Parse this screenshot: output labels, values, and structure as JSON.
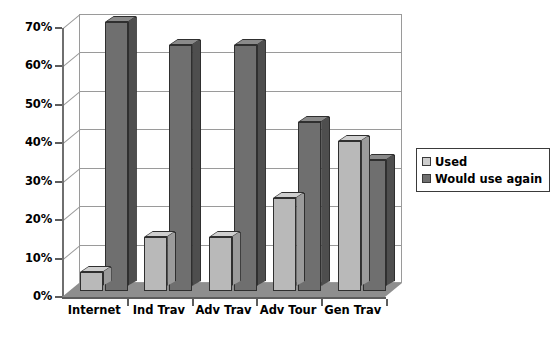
{
  "chart_data": {
    "type": "bar",
    "title": "",
    "subtitle": "",
    "xlabel": "",
    "ylabel": "",
    "categories": [
      "Internet",
      "Ind Trav",
      "Adv Trav",
      "Adv Tour",
      "Gen Trav"
    ],
    "series": [
      {
        "name": "Used",
        "color": "#b9b9b9",
        "values": [
          5,
          14,
          14,
          24,
          39
        ]
      },
      {
        "name": "Would use again",
        "color": "#6f6f6f",
        "values": [
          70,
          64,
          64,
          44,
          34
        ]
      }
    ],
    "ylim": [
      0,
      70
    ],
    "ytick_values": [
      0,
      10,
      20,
      30,
      40,
      50,
      60,
      70
    ],
    "ytick_labels": [
      "0%",
      "10%",
      "20%",
      "30%",
      "40%",
      "50%",
      "60%",
      "70%"
    ],
    "grid": true,
    "grid_axis": "y",
    "legend_position": "right",
    "style": "3d-column",
    "value_format": "percent"
  },
  "legend": {
    "items": [
      {
        "label": "Used",
        "swatch": "light-gray-square"
      },
      {
        "label": "Would use again",
        "swatch": "dark-gray-square"
      }
    ]
  }
}
